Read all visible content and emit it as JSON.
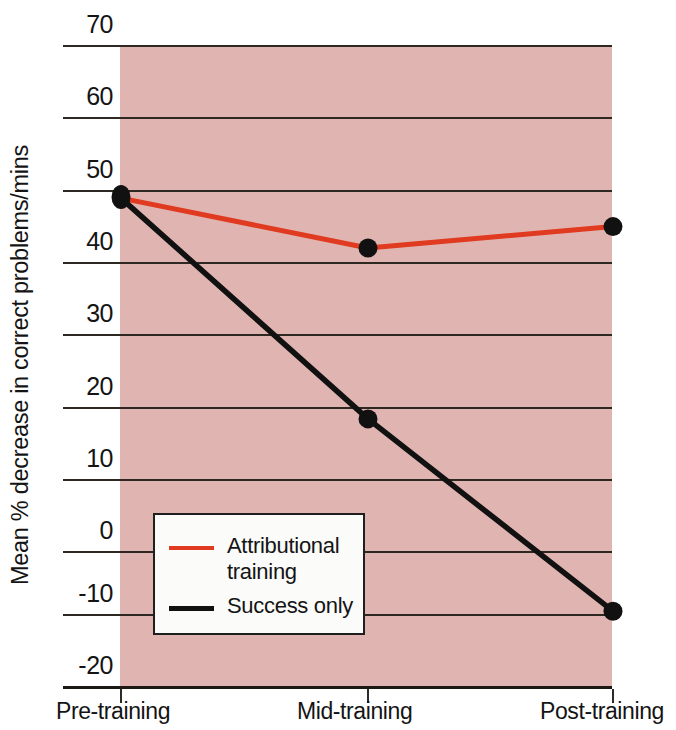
{
  "chart_data": {
    "type": "line",
    "title": "",
    "xlabel": "",
    "ylabel": "Mean % decrease in correct problems/mins",
    "categories": [
      "Pre-training",
      "Mid-training",
      "Post-training"
    ],
    "series": [
      {
        "name": "Attributional training",
        "color": "#e03a20",
        "values": [
          48.5,
          41.5,
          44.5
        ]
      },
      {
        "name": "Success only",
        "color": "#111111",
        "values": [
          48.5,
          17.5,
          -9.5
        ]
      }
    ],
    "ylim": [
      -20,
      70
    ],
    "y_ticks": [
      70,
      60,
      50,
      40,
      30,
      20,
      10,
      0,
      -10,
      -20
    ],
    "y_tick_labels": [
      "70",
      "60",
      "50",
      "40",
      "30",
      "20",
      "10",
      "0",
      "-10",
      "-20"
    ],
    "grid": true,
    "grid_axis": "y",
    "legend_position": "inside-lower-left",
    "plot_background": "#e0b5b1",
    "figure_background": "#ffffff",
    "markers": "filled-circle"
  },
  "axes": {
    "y_title": "Mean % decrease in correct problems/mins",
    "y_tick_labels": [
      "70",
      "60",
      "50",
      "40",
      "30",
      "20",
      "10",
      "0",
      "-10",
      "-20"
    ],
    "x_tick_labels": [
      "Pre-training",
      "Mid-training",
      "Post-training"
    ]
  },
  "legend": {
    "entries": [
      {
        "label": "Attributional\ntraining",
        "swatch": "red-line-swatch"
      },
      {
        "label": "Success only",
        "swatch": "black-line-swatch"
      }
    ]
  }
}
